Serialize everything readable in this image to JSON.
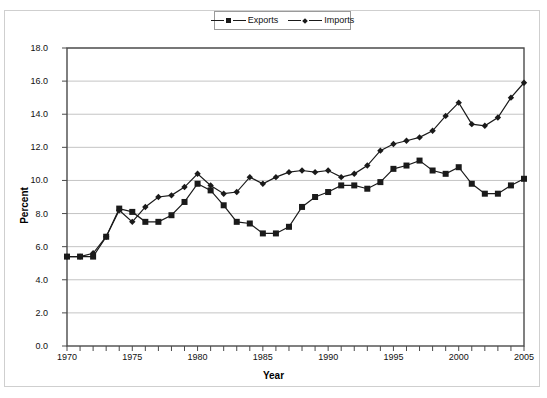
{
  "chart_data": {
    "type": "line",
    "title": "",
    "xlabel": "Year",
    "ylabel": "Percent",
    "xlim": [
      1970,
      2005
    ],
    "ylim": [
      0.0,
      18.0
    ],
    "ytick_step": 2.0,
    "ytick_labels": [
      "0.0",
      "2.0",
      "4.0",
      "6.0",
      "8.0",
      "10.0",
      "12.0",
      "14.0",
      "16.0",
      "18.0"
    ],
    "xtick_labels": [
      "1970",
      "1975",
      "1980",
      "1985",
      "1990",
      "1995",
      "2000",
      "2005"
    ],
    "xtick_interval_minor": 1,
    "grid": "horizontal",
    "legend_position": "top-center",
    "x": [
      1970,
      1971,
      1972,
      1973,
      1974,
      1975,
      1976,
      1977,
      1978,
      1979,
      1980,
      1981,
      1982,
      1983,
      1984,
      1985,
      1986,
      1987,
      1988,
      1989,
      1990,
      1991,
      1992,
      1993,
      1994,
      1995,
      1996,
      1997,
      1998,
      1999,
      2000,
      2001,
      2002,
      2003,
      2004,
      2005
    ],
    "series": [
      {
        "name": "Exports",
        "marker": "square",
        "color": "#1a1a1a",
        "values": [
          5.4,
          5.4,
          5.4,
          6.6,
          8.3,
          8.1,
          7.5,
          7.5,
          7.9,
          8.7,
          9.8,
          9.4,
          8.5,
          7.5,
          7.4,
          6.8,
          6.8,
          7.2,
          8.4,
          9.0,
          9.3,
          9.7,
          9.7,
          9.5,
          9.9,
          10.7,
          10.9,
          11.2,
          10.6,
          10.4,
          10.8,
          9.8,
          9.2,
          9.2,
          9.7,
          10.1
        ]
      },
      {
        "name": "Imports",
        "marker": "diamond",
        "color": "#1a1a1a",
        "values": [
          5.4,
          5.4,
          5.6,
          6.6,
          8.2,
          7.5,
          8.4,
          9.0,
          9.1,
          9.6,
          10.4,
          9.7,
          9.2,
          9.3,
          10.2,
          9.8,
          10.2,
          10.5,
          10.6,
          10.5,
          10.6,
          10.2,
          10.4,
          10.9,
          11.8,
          12.2,
          12.4,
          12.6,
          13.0,
          13.9,
          14.7,
          13.4,
          13.3,
          13.8,
          15.0,
          15.9
        ]
      }
    ]
  },
  "legend": {
    "items": [
      {
        "label": "Exports",
        "marker": "square-marker"
      },
      {
        "label": "Imports",
        "marker": "diamond-marker"
      }
    ]
  },
  "axes": {
    "y_title": "Percent",
    "x_title": "Year"
  }
}
